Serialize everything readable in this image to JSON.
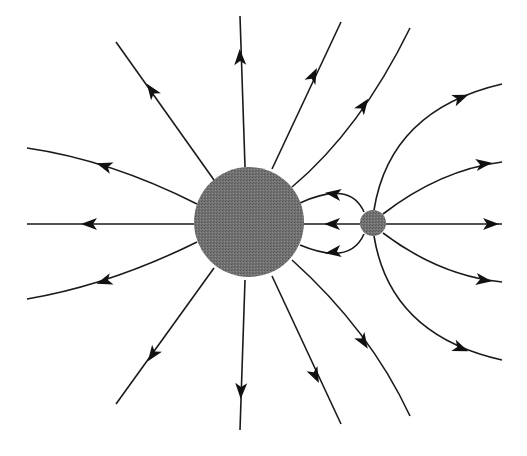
{
  "diagram": {
    "type": "electric-field-lines",
    "colors": {
      "charge_fill": "#6e6e6e",
      "line": "#1a1a1a",
      "background": "#ffffff"
    },
    "charges": [
      {
        "name": "large-charge",
        "cx": 249,
        "cy": 222,
        "r": 55
      },
      {
        "name": "small-charge",
        "cx": 373,
        "cy": 223,
        "r": 13
      }
    ],
    "field_line_count": 20,
    "arrow_count": 20
  }
}
